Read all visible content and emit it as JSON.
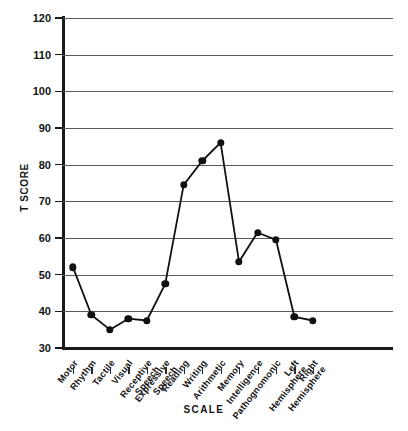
{
  "chart_data": {
    "type": "line",
    "title": "",
    "xlabel": "SCALE",
    "ylabel": "T SCORE",
    "ylim": [
      30,
      120
    ],
    "yticks": [
      30,
      40,
      50,
      60,
      70,
      80,
      90,
      100,
      110,
      120
    ],
    "grid": true,
    "legend": null,
    "categories": [
      "Motor",
      "Rhythm",
      "Tactile",
      "Visual",
      "Receptive Speech",
      "Expressive Speech",
      "Reading",
      "Writing",
      "Arithmetic",
      "Memory",
      "Intelligence",
      "Pathognomonic",
      "Left Hemisphere",
      "Right Hemisphere"
    ],
    "category_lines": [
      [
        "Motor"
      ],
      [
        "Rhythm"
      ],
      [
        "Tactile"
      ],
      [
        "Visual"
      ],
      [
        "Receptive",
        "Speech"
      ],
      [
        "Expressive",
        "Speech"
      ],
      [
        "Reading"
      ],
      [
        "Writing"
      ],
      [
        "Arithmetic"
      ],
      [
        "Memory"
      ],
      [
        "Intelligence"
      ],
      [
        "Pathognomonic"
      ],
      [
        "Left",
        "Hemisphere"
      ],
      [
        "Right",
        "Hemisphere"
      ]
    ],
    "values": [
      52,
      39,
      35,
      38,
      37.5,
      47.5,
      74.5,
      81,
      86,
      53.5,
      61.5,
      59.5,
      38.5,
      37.5
    ],
    "series": [
      {
        "name": "T Score Profile",
        "values": [
          52,
          39,
          35,
          38,
          37.5,
          47.5,
          74.5,
          81,
          86,
          53.5,
          61.5,
          59.5,
          38.5,
          37.5
        ],
        "marker": "filled-circle",
        "color": "#111111"
      }
    ],
    "colors": {
      "line": "#111111",
      "marker": "#111111",
      "grid": "#5a5a5a",
      "axis": "#1a1a1a",
      "background": "#ffffff"
    }
  }
}
